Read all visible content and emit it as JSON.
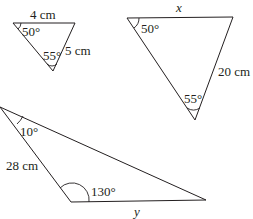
{
  "triangles": [
    {
      "id": "small",
      "labels": {
        "top_side": "4 cm",
        "top_left_angle": "50°",
        "bottom_angle": "55°",
        "right_side": "5 cm"
      }
    },
    {
      "id": "large",
      "labels": {
        "top_side": "x",
        "top_left_angle": "50°",
        "bottom_angle": "55°",
        "right_side": "20 cm"
      }
    },
    {
      "id": "obtuse",
      "labels": {
        "left_angle": "10°",
        "left_side": "28 cm",
        "obtuse_angle": "130°",
        "bottom_side": "y"
      }
    }
  ]
}
